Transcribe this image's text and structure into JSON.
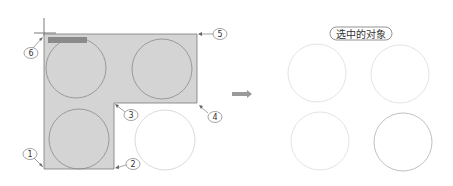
{
  "diagram": {
    "title": "选中的对象",
    "callouts": [
      {
        "number": "1"
      },
      {
        "number": "2"
      },
      {
        "number": "3"
      },
      {
        "number": "4"
      },
      {
        "number": "5"
      },
      {
        "number": "6"
      }
    ],
    "cursor_tooltip": "指定对角点",
    "colors": {
      "selection_fill": "#d4d4d4",
      "selection_border": "#7a7a7a",
      "circle_stroke_selected": "#8a8a8a",
      "circle_stroke_unselected": "#d8d8d8",
      "arrow": "#9a9a9a"
    }
  }
}
